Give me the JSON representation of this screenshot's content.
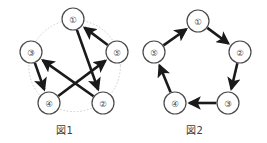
{
  "figures": [
    {
      "id": "figure-1",
      "caption": "図1",
      "layout": "star",
      "guide_circle": true,
      "nodes": [
        {
          "id": "1",
          "label": "①",
          "x": 73,
          "y": 19
        },
        {
          "id": "2",
          "label": "②",
          "x": 103,
          "y": 103
        },
        {
          "id": "3",
          "label": "③",
          "x": 31,
          "y": 52
        },
        {
          "id": "4",
          "label": "④",
          "x": 49,
          "y": 103
        },
        {
          "id": "5",
          "label": "⑤",
          "x": 117,
          "y": 52
        }
      ],
      "edges": [
        {
          "from": "1",
          "to": "2",
          "directed": true
        },
        {
          "from": "2",
          "to": "3",
          "directed": true
        },
        {
          "from": "3",
          "to": "4",
          "directed": true
        },
        {
          "from": "4",
          "to": "5",
          "directed": true
        },
        {
          "from": "5",
          "to": "1",
          "directed": true
        }
      ]
    },
    {
      "id": "figure-2",
      "caption": "図2",
      "layout": "pentagon",
      "guide_circle": false,
      "nodes": [
        {
          "id": "1",
          "label": "①",
          "x": 198,
          "y": 21
        },
        {
          "id": "2",
          "label": "②",
          "x": 240,
          "y": 52
        },
        {
          "id": "3",
          "label": "③",
          "x": 228,
          "y": 103
        },
        {
          "id": "4",
          "label": "④",
          "x": 175,
          "y": 103
        },
        {
          "id": "5",
          "label": "⑤",
          "x": 154,
          "y": 52
        }
      ],
      "edges": [
        {
          "from": "1",
          "to": "2",
          "directed": true
        },
        {
          "from": "2",
          "to": "3",
          "directed": true
        },
        {
          "from": "3",
          "to": "4",
          "directed": true
        },
        {
          "from": "4",
          "to": "5",
          "directed": true
        },
        {
          "from": "5",
          "to": "1",
          "directed": true
        }
      ]
    }
  ],
  "style": {
    "node_radius": 11,
    "node_stroke": "#4a4a4a",
    "node_fill": "#ffffff",
    "edge_color": "#1a1a1a",
    "edge_width": 2.6,
    "guide_circle_color": "#c8c8c8",
    "background": "#ffffff",
    "caption_color": "#3c3c3c"
  }
}
